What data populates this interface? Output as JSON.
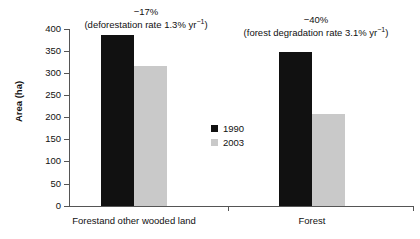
{
  "chart_data": {
    "type": "bar",
    "title": "",
    "xlabel": "",
    "ylabel": "Area (ha)",
    "ylim": [
      0,
      400
    ],
    "yticks": [
      0,
      50,
      100,
      150,
      200,
      250,
      300,
      350,
      400
    ],
    "ytick_labels": [
      "0",
      "50",
      "100",
      "150",
      "200",
      "250",
      "300",
      "350",
      "400"
    ],
    "grid": false,
    "legend_position": "center",
    "categories": [
      "Forestand other wooded land",
      "Forest"
    ],
    "series": [
      {
        "name": "1990",
        "color": "#111111",
        "values": [
          386,
          348
        ]
      },
      {
        "name": "2003",
        "color": "#c9c9c9",
        "values": [
          316,
          207
        ]
      }
    ],
    "annotations": [
      {
        "category": "Forestand other wooded land",
        "percent_change": "−17%",
        "rate_prefix": "(deforestation rate 1.3% yr",
        "rate_exponent": "−1",
        "rate_suffix": ")"
      },
      {
        "category": "Forest",
        "percent_change": "−40%",
        "rate_prefix": "(forest degradation rate 3.1% yr",
        "rate_exponent": "−1",
        "rate_suffix": ")"
      }
    ]
  },
  "axes": {
    "y_title": "Area (ha)",
    "y_labels": {
      "t400": "400",
      "t350": "350",
      "t300": "300",
      "t250": "250",
      "t200": "200",
      "t150": "150",
      "t100": "100",
      "t50": "50",
      "t0": "0"
    },
    "x_labels": {
      "cat1": "Forestand other wooded land",
      "cat2": "Forest"
    }
  },
  "legend": {
    "entries": [
      {
        "label": "1990"
      },
      {
        "label": "2003"
      }
    ]
  }
}
